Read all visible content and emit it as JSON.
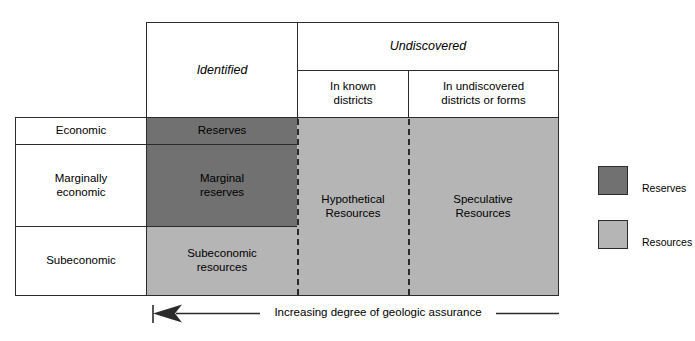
{
  "diagram": {
    "columns": {
      "identified": "Identified",
      "undiscovered": "Undiscovered",
      "in_known_districts": "In known\ndistricts",
      "in_undiscovered_districts": "In undiscovered\ndistricts or forms"
    },
    "rows": [
      {
        "label": "Economic"
      },
      {
        "label": "Marginally\neconomic"
      },
      {
        "label": "Subeconomic"
      }
    ],
    "cells": {
      "reserves": "Reserves",
      "marginal_reserves": "Marginal\nreserves",
      "subeconomic_resources": "Subeconomic\nresources",
      "hypothetical_resources": "Hypothetical\nResources",
      "speculative_resources": "Speculative\nResources"
    },
    "axis": {
      "assurance_label": "Increasing degree of geologic assurance",
      "arrow_direction": "left"
    },
    "legend": [
      {
        "key": "reserves",
        "label": "Reserves",
        "color": "#717171"
      },
      {
        "key": "resources",
        "label": "Resources",
        "color": "#b5b5b5"
      }
    ],
    "colors": {
      "reserves_fill": "#717171",
      "resources_fill": "#b5b5b5",
      "line": "#2b2b2b",
      "background": "#ffffff"
    }
  }
}
